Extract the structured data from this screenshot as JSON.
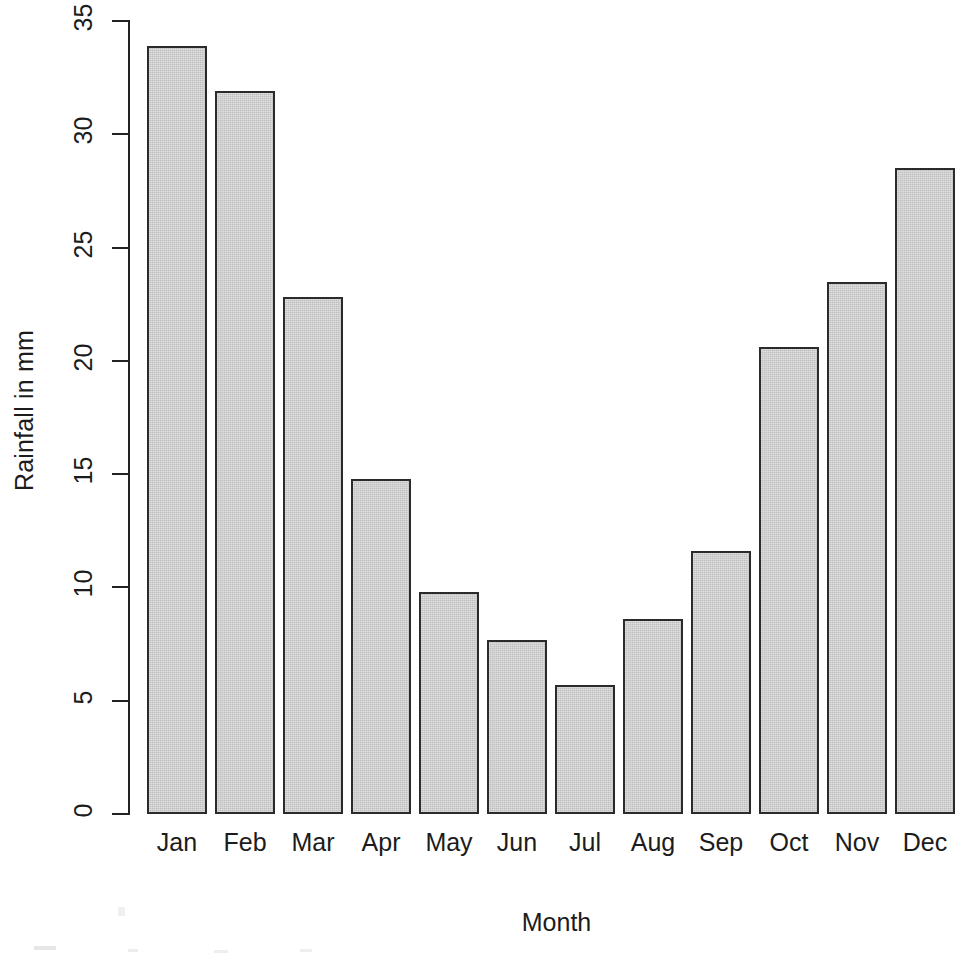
{
  "chart_data": {
    "type": "bar",
    "title": "",
    "xlabel": "Month",
    "ylabel": "Rainfall in mm",
    "categories": [
      "Jan",
      "Feb",
      "Mar",
      "Apr",
      "May",
      "Jun",
      "Jul",
      "Aug",
      "Sep",
      "Oct",
      "Nov",
      "Dec"
    ],
    "values": [
      33.9,
      31.9,
      22.8,
      14.8,
      9.8,
      7.7,
      5.7,
      8.6,
      11.6,
      20.6,
      23.5,
      28.5
    ],
    "ylim": [
      0,
      35
    ],
    "y_ticks": [
      0,
      5,
      10,
      15,
      20,
      25,
      30,
      35
    ],
    "y_tick_labels": [
      "0",
      "5",
      "10",
      "15",
      "20",
      "25",
      "30",
      "35"
    ],
    "grid": false,
    "legend": false,
    "legend_position": "none",
    "bar_fill_color": "#bfbfbf",
    "bar_border_color": "#2b2b2b",
    "axis_color": "#222222",
    "background_color": "#ffffff"
  },
  "axes": {
    "y_title": "Rainfall in mm",
    "x_title": "Month"
  }
}
